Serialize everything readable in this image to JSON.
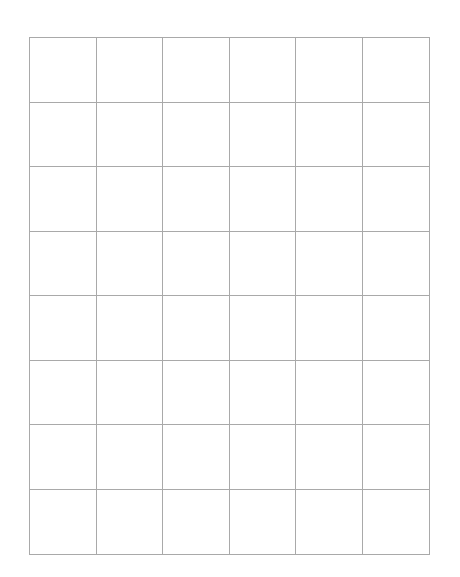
{
  "grid": {
    "columns": 6,
    "rows": 8,
    "line_color": "#a9a9a9",
    "background": "#ffffff",
    "cells": []
  }
}
